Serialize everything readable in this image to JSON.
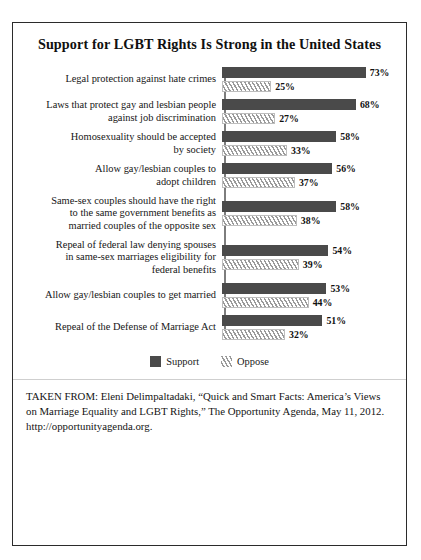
{
  "figure": {
    "title": "Support for LGBT Rights Is Strong in the United States",
    "legend": {
      "support_label": "Support",
      "oppose_label": "Oppose"
    },
    "citation": "TAKEN FROM: Eleni Delimpaltadaki, “Quick and Smart Facts: America’s Views on Marriage Equality and LGBT Rights,” The Opportunity Agenda, May 11, 2012. http://opportunityagenda.org."
  },
  "chart_data": {
    "type": "bar",
    "orientation": "horizontal",
    "title": "Support for LGBT Rights Is Strong in the United States",
    "xlabel": "",
    "ylabel": "",
    "xlim": [
      0,
      100
    ],
    "grid": false,
    "legend_position": "bottom-center",
    "value_suffix": "%",
    "colors": {
      "support": "#4a4a4a",
      "oppose_hatch": "#9a9a9a",
      "oppose_fill": "#f2f2f2",
      "axis": "#7d7d7d",
      "frame": "#2b2b2b"
    },
    "categories": [
      "Legal protection against hate crimes",
      "Laws that protect gay and lesbian people against job discrimination",
      "Homosexuality should be accepted by society",
      "Allow gay/lesbian couples to adopt children",
      "Same-sex couples should have the right to the same government benefits as married couples of the opposite sex",
      "Repeal of federal law denying spouses in same-sex marriages eligibility for federal benefits",
      "Allow gay/lesbian couples to get married",
      "Repeal of the Defense of Marriage Act"
    ],
    "series": [
      {
        "name": "Support",
        "values": [
          73,
          68,
          58,
          56,
          58,
          54,
          53,
          51
        ]
      },
      {
        "name": "Oppose",
        "values": [
          25,
          27,
          33,
          37,
          38,
          39,
          44,
          32
        ]
      }
    ],
    "rows": [
      {
        "label_lines": [
          "Legal protection against hate crimes"
        ],
        "support": 73,
        "oppose": 25,
        "support_text": "73%",
        "oppose_text": "25%"
      },
      {
        "label_lines": [
          "Laws that protect gay and lesbian people",
          "against job discrimination"
        ],
        "support": 68,
        "oppose": 27,
        "support_text": "68%",
        "oppose_text": "27%"
      },
      {
        "label_lines": [
          "Homosexuality should be accepted",
          "by society"
        ],
        "support": 58,
        "oppose": 33,
        "support_text": "58%",
        "oppose_text": "33%"
      },
      {
        "label_lines": [
          "Allow gay/lesbian couples to",
          "adopt children"
        ],
        "support": 56,
        "oppose": 37,
        "support_text": "56%",
        "oppose_text": "37%"
      },
      {
        "label_lines": [
          "Same-sex couples should have the right",
          "to the same government benefits as",
          "married couples of the opposite sex"
        ],
        "support": 58,
        "oppose": 38,
        "support_text": "58%",
        "oppose_text": "38%"
      },
      {
        "label_lines": [
          "Repeal of federal law denying spouses",
          "in same-sex marriages eligibility for",
          "federal benefits"
        ],
        "support": 54,
        "oppose": 39,
        "support_text": "54%",
        "oppose_text": "39%"
      },
      {
        "label_lines": [
          "Allow gay/lesbian couples to get married"
        ],
        "support": 53,
        "oppose": 44,
        "support_text": "53%",
        "oppose_text": "44%"
      },
      {
        "label_lines": [
          "Repeal of the Defense of Marriage Act"
        ],
        "support": 51,
        "oppose": 32,
        "support_text": "51%",
        "oppose_text": "32%"
      }
    ]
  }
}
